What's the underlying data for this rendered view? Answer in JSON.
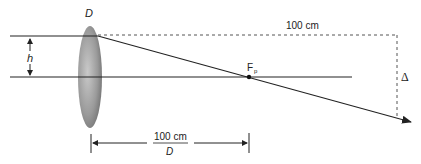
{
  "diagram": {
    "lens_label": "D",
    "height_label": "h",
    "top_distance_label": "100 cm",
    "focal_point_label": "F",
    "focal_point_subscript": "p",
    "delta_label": "Δ",
    "bottom_dimension": {
      "numerator": "100 cm",
      "denominator": "D"
    },
    "colors": {
      "line": "#222222",
      "lens_dark": "#6e6e6e",
      "lens_light": "#bdbdbd",
      "dashed": "#555555"
    }
  }
}
